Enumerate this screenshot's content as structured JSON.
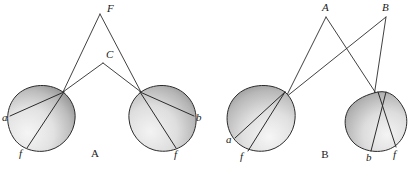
{
  "figure": {
    "width": 419,
    "height": 169,
    "background": "#ffffff",
    "ink_color": "#2b2b2b",
    "panels": [
      {
        "id": "panel-a",
        "label": "A",
        "label_pos": {
          "x": 95,
          "y": 157
        },
        "apex_points": [
          {
            "name": "F",
            "label": "F",
            "x": 100,
            "y": 14,
            "label_x": 107,
            "label_y": 12
          },
          {
            "name": "C",
            "label": "C",
            "x": 103,
            "y": 63,
            "label_x": 106,
            "label_y": 58
          }
        ],
        "circles": [
          {
            "id": "a-left-circle",
            "cx": 42,
            "cy": 118,
            "r": 33,
            "node": {
              "x": 63,
              "y": 92
            },
            "points": [
              {
                "name": "a",
                "label": "a",
                "x": 10,
                "y": 116,
                "label_x": 2,
                "label_y": 121
              },
              {
                "name": "f",
                "label": "f",
                "x": 27,
                "y": 148,
                "label_x": 19,
                "label_y": 156
              }
            ]
          },
          {
            "id": "a-right-circle",
            "cx": 162,
            "cy": 118,
            "r": 33,
            "node": {
              "x": 141,
              "y": 92
            },
            "points": [
              {
                "name": "b",
                "label": "b",
                "x": 194,
                "y": 116,
                "label_x": 196,
                "label_y": 121
              },
              {
                "name": "f",
                "label": "f",
                "x": 176,
                "y": 148,
                "label_x": 174,
                "label_y": 157
              }
            ]
          }
        ],
        "rays": [
          {
            "from": "F",
            "to": "a-left-node"
          },
          {
            "from": "F",
            "to": "a-right-node"
          },
          {
            "from": "C",
            "to": "a-left-node"
          },
          {
            "from": "C",
            "to": "a-right-node"
          }
        ]
      },
      {
        "id": "panel-b",
        "label": "B",
        "label_pos": {
          "x": 325,
          "y": 158
        },
        "apex_points": [
          {
            "name": "A",
            "label": "A",
            "x": 326,
            "y": 17,
            "label_x": 324,
            "label_y": 11
          },
          {
            "name": "B",
            "label": "B",
            "x": 386,
            "y": 17,
            "label_x": 383,
            "label_y": 11
          }
        ],
        "circles": [
          {
            "id": "b-left-circle",
            "cx": 262,
            "cy": 118,
            "r": 33,
            "node": {
              "x": 285,
              "y": 92
            },
            "points": [
              {
                "name": "a",
                "label": "a",
                "x": 235,
                "y": 138,
                "label_x": 227,
                "label_y": 143
              },
              {
                "name": "f",
                "label": "f",
                "x": 248,
                "y": 150,
                "label_x": 240,
                "label_y": 159
              }
            ]
          },
          {
            "id": "b-right-circle",
            "cx": 376,
            "cy": 118,
            "r": 33,
            "node": {
              "x": 378,
              "y": 92
            },
            "points": [
              {
                "name": "b",
                "label": "b",
                "x": 371,
                "y": 151,
                "label_x": 366,
                "label_y": 160
              },
              {
                "name": "f",
                "label": "f",
                "x": 396,
                "y": 146,
                "label_x": 393,
                "label_y": 157
              }
            ]
          }
        ],
        "rays": [
          {
            "from": "A",
            "to": "b-left-node"
          },
          {
            "from": "A",
            "to": "b-right-node"
          },
          {
            "from": "B",
            "to": "b-left-node"
          },
          {
            "from": "B",
            "to": "b-right-node"
          }
        ]
      }
    ]
  }
}
